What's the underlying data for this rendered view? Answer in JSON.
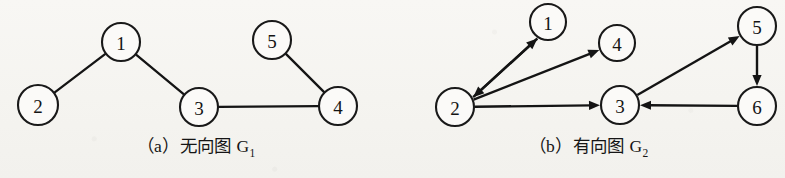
{
  "figure": {
    "background_color": "#f6f5f1",
    "ink_color": "#141414",
    "panels": [
      {
        "id": "a",
        "caption": "（a）无向图 G",
        "caption_subscript": "1",
        "graph_type": "undirected",
        "graph_name": "G1"
      },
      {
        "id": "b",
        "caption": "（b）有向图 G",
        "caption_subscript": "2",
        "graph_type": "directed",
        "graph_name": "G2"
      }
    ]
  },
  "chart_data": [
    {
      "type": "diagram",
      "subtype": "undirected-graph",
      "title": "（a）无向图 G1",
      "directed": false,
      "nodes": [
        {
          "id": "1",
          "label": "1",
          "x": 121,
          "y": 42,
          "r": 19
        },
        {
          "id": "2",
          "label": "2",
          "x": 38,
          "y": 105,
          "r": 20
        },
        {
          "id": "3",
          "label": "3",
          "x": 199,
          "y": 107,
          "r": 19
        },
        {
          "id": "4",
          "label": "4",
          "x": 338,
          "y": 106,
          "r": 19
        },
        {
          "id": "5",
          "label": "5",
          "x": 272,
          "y": 40,
          "r": 19
        }
      ],
      "edges": [
        {
          "from": "1",
          "to": "2"
        },
        {
          "from": "1",
          "to": "3"
        },
        {
          "from": "3",
          "to": "4"
        },
        {
          "from": "5",
          "to": "4"
        }
      ]
    },
    {
      "type": "diagram",
      "subtype": "directed-graph",
      "title": "（b）有向图 G2",
      "directed": true,
      "nodes": [
        {
          "id": "1",
          "label": "1",
          "x": 156,
          "y": 22,
          "r": 18
        },
        {
          "id": "2",
          "label": "2",
          "x": 63,
          "y": 107,
          "r": 19
        },
        {
          "id": "3",
          "label": "3",
          "x": 228,
          "y": 105,
          "r": 19
        },
        {
          "id": "4",
          "label": "4",
          "x": 225,
          "y": 43,
          "r": 18
        },
        {
          "id": "5",
          "label": "5",
          "x": 365,
          "y": 26,
          "r": 19
        },
        {
          "id": "6",
          "label": "6",
          "x": 365,
          "y": 106,
          "r": 19
        }
      ],
      "edges": [
        {
          "from": "2",
          "to": "1",
          "offset": 5
        },
        {
          "from": "1",
          "to": "2",
          "offset": -5
        },
        {
          "from": "2",
          "to": "4",
          "offset": 0
        },
        {
          "from": "2",
          "to": "3",
          "offset": 0
        },
        {
          "from": "3",
          "to": "5",
          "offset": 0
        },
        {
          "from": "5",
          "to": "6",
          "offset": 0
        },
        {
          "from": "6",
          "to": "3",
          "offset": 0
        }
      ]
    }
  ]
}
